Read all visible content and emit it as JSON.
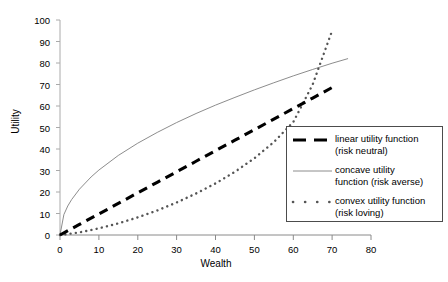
{
  "chart_data": {
    "type": "line",
    "title": "",
    "xlabel": "Wealth",
    "ylabel": "Utility",
    "xlim": [
      0,
      80
    ],
    "ylim": [
      0,
      100
    ],
    "xticks": [
      "0",
      "10",
      "20",
      "30",
      "40",
      "50",
      "60",
      "70",
      "80"
    ],
    "yticks": [
      "0",
      "10",
      "20",
      "30",
      "40",
      "50",
      "60",
      "70",
      "80",
      "90",
      "100"
    ],
    "grid": false,
    "legend_position": "bottom-right",
    "series": [
      {
        "name": "linear utility function (risk neutral)",
        "legend_line1": "linear utility function",
        "legend_line2": "(risk neutral)",
        "style": "thick-dashed",
        "color": "#000000",
        "x": [
          0,
          5,
          10,
          15,
          20,
          25,
          30,
          35,
          40,
          45,
          50,
          55,
          60,
          65,
          70
        ],
        "y": [
          0,
          4.9,
          9.8,
          14.7,
          19.6,
          24.5,
          29.4,
          34.3,
          39.2,
          44.1,
          49,
          53.9,
          58.8,
          63.7,
          68.6
        ]
      },
      {
        "name": "concave utility function (risk averse)",
        "legend_line1": "concave utility",
        "legend_line2": "function (risk averse)",
        "style": "thin-solid",
        "color": "#7f7f7f",
        "x": [
          0,
          1,
          2,
          3,
          5,
          8,
          10,
          15,
          20,
          25,
          30,
          35,
          40,
          45,
          50,
          55,
          60,
          65,
          70,
          74
        ],
        "y": [
          0,
          9.5,
          13.5,
          16.5,
          21.3,
          27,
          30.2,
          37,
          42.7,
          47.7,
          52.3,
          56.5,
          60.4,
          64,
          67.5,
          70.8,
          74,
          77,
          79.9,
          82
        ]
      },
      {
        "name": "convex utility function (risk loving)",
        "legend_line1": "convex utility function",
        "legend_line2": "(risk loving)",
        "style": "dotted",
        "color": "#555555",
        "x": [
          0,
          5,
          10,
          15,
          20,
          25,
          30,
          35,
          40,
          45,
          50,
          55,
          60,
          65,
          70
        ],
        "y": [
          0,
          1.2,
          3.1,
          5.4,
          8.2,
          11.4,
          15.1,
          19.3,
          24.0,
          29.4,
          35.7,
          43.2,
          52.5,
          70.0,
          95.0
        ]
      }
    ]
  },
  "axes": {
    "x_title": "Wealth",
    "y_title": "Utility"
  }
}
